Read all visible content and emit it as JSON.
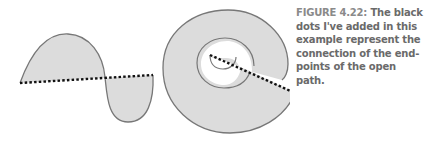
{
  "caption": {
    "label": "FIGURE 4.22:",
    "text": "The black dots I've added in this example represent the connection of the end-points of the open path."
  },
  "figure": {
    "fill_color": "#dcdcdc",
    "stroke_color": "#777777",
    "dots_color": "#111111",
    "shapes": [
      {
        "name": "wave-shape",
        "description": "S-curve open path with dotted closing line"
      },
      {
        "name": "spiral-shape",
        "description": "Spiral open path with dotted closing line"
      }
    ]
  }
}
